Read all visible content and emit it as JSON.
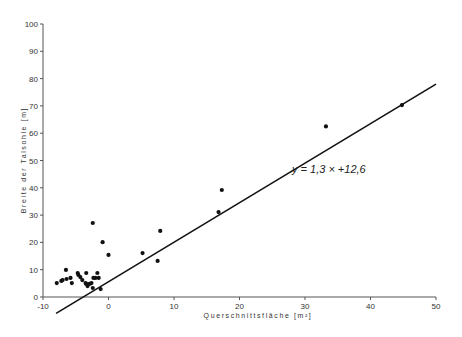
{
  "chart_data": {
    "type": "scatter",
    "title": "",
    "xlabel": "Querschnittsfläche [m²]",
    "ylabel": "Breite der Talsohle [m]",
    "xlim": [
      -10,
      50
    ],
    "ylim": [
      0,
      100
    ],
    "xticks": [
      -10,
      0,
      10,
      20,
      30,
      40,
      50
    ],
    "yticks": [
      0,
      10,
      20,
      30,
      40,
      50,
      60,
      70,
      80,
      90,
      100
    ],
    "grid": false,
    "legend": null,
    "annotation": "y = 1,3 × +12,6",
    "regression_line": {
      "slope": 1.3,
      "intercept": 12.6,
      "x_from": -8,
      "x_to": 50
    },
    "points": [
      {
        "x": -7.9,
        "y": 5.1
      },
      {
        "x": -7.2,
        "y": 5.9
      },
      {
        "x": -7.0,
        "y": 6.2
      },
      {
        "x": -6.5,
        "y": 9.9
      },
      {
        "x": -6.4,
        "y": 6.6
      },
      {
        "x": -5.8,
        "y": 7.0
      },
      {
        "x": -5.6,
        "y": 5.1
      },
      {
        "x": -4.7,
        "y": 8.8
      },
      {
        "x": -4.6,
        "y": 8.1
      },
      {
        "x": -4.3,
        "y": 7.3
      },
      {
        "x": -4.0,
        "y": 6.2
      },
      {
        "x": -3.5,
        "y": 5.1
      },
      {
        "x": -3.4,
        "y": 4.8
      },
      {
        "x": -3.2,
        "y": 4.0
      },
      {
        "x": -2.9,
        "y": 4.8
      },
      {
        "x": -2.6,
        "y": 5.1
      },
      {
        "x": -3.4,
        "y": 8.8
      },
      {
        "x": -2.4,
        "y": 3.3
      },
      {
        "x": -1.7,
        "y": 8.8
      },
      {
        "x": -1.5,
        "y": 7.0
      },
      {
        "x": -1.2,
        "y": 2.9
      },
      {
        "x": -2.0,
        "y": 7.0
      },
      {
        "x": -2.3,
        "y": 7.0
      },
      {
        "x": -2.4,
        "y": 27.1
      },
      {
        "x": -0.9,
        "y": 20.1
      },
      {
        "x": 0.0,
        "y": 15.4
      },
      {
        "x": 5.2,
        "y": 16.1
      },
      {
        "x": 7.5,
        "y": 13.2
      },
      {
        "x": 7.9,
        "y": 24.2
      },
      {
        "x": 16.8,
        "y": 31.1
      },
      {
        "x": 17.3,
        "y": 39.2
      },
      {
        "x": 33.2,
        "y": 62.5
      },
      {
        "x": 44.8,
        "y": 70.3
      }
    ]
  },
  "labels": {
    "xlabel": "Querschnittsfläche [m²]",
    "ylabel": "Breite der Talsohle [m]",
    "equation": "y = 1,3 × +12,6"
  }
}
